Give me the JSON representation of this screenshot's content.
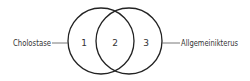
{
  "diagram": {
    "type": "venn",
    "sets": [
      {
        "label": "Cholostase",
        "region_number": "1"
      },
      {
        "label": "Allgemeinikterus",
        "region_number": "3"
      }
    ],
    "intersection": {
      "region_number": "2"
    },
    "colors": {
      "stroke": "#222222",
      "text": "#333333",
      "background": "#ffffff"
    }
  }
}
